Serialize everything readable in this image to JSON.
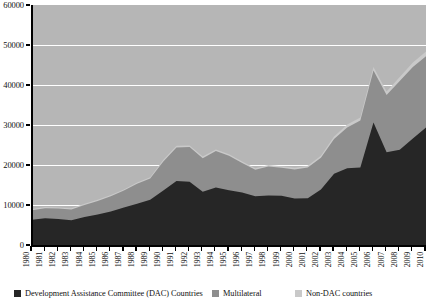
{
  "chart_data": {
    "type": "area",
    "stacked": true,
    "title": "",
    "subtitle": "",
    "xlabel": "",
    "ylabel": "",
    "ylim": [
      0,
      60000
    ],
    "ytick_labels": [
      "0",
      "10000",
      "20000",
      "30000",
      "40000",
      "50000",
      "60000"
    ],
    "ytick_values": [
      0,
      10000,
      20000,
      30000,
      40000,
      50000,
      60000
    ],
    "grid": "horizontal-white",
    "legend_position": "bottom",
    "x": [
      1980,
      1981,
      1982,
      1983,
      1984,
      1985,
      1986,
      1987,
      1988,
      1989,
      1990,
      1991,
      1992,
      1993,
      1994,
      1995,
      1996,
      1997,
      1998,
      1999,
      2000,
      2001,
      2002,
      2003,
      2004,
      2005,
      2006,
      2007,
      2008,
      2009,
      2010
    ],
    "categories": [
      "1980",
      "1981",
      "1982",
      "1983",
      "1984",
      "1985",
      "1986",
      "1987",
      "1988",
      "1989",
      "1990",
      "1991",
      "1992",
      "1993",
      "1994",
      "1995",
      "1996",
      "1997",
      "1998",
      "1999",
      "2000",
      "2001",
      "2002",
      "2003",
      "2004",
      "2005",
      "2006",
      "2007",
      "2008",
      "2009",
      "2010"
    ],
    "series": [
      {
        "name": "Development Assistance Committee (DAC) Countries",
        "color": "#262626",
        "values": [
          6300,
          6700,
          6500,
          6200,
          7000,
          7600,
          8400,
          9400,
          10300,
          11300,
          13600,
          16000,
          15800,
          13300,
          14400,
          13700,
          13100,
          12200,
          12400,
          12300,
          11600,
          11700,
          13900,
          17800,
          19200,
          19400,
          30600,
          23200,
          23800,
          26600,
          29400
        ]
      },
      {
        "name": "Multilateral",
        "color": "#8e8e8e",
        "values": [
          2400,
          2500,
          2600,
          2700,
          3000,
          3400,
          3800,
          4200,
          5000,
          5300,
          7300,
          8400,
          8700,
          8400,
          9100,
          8600,
          7400,
          6600,
          7200,
          7000,
          7300,
          7700,
          7900,
          8700,
          10200,
          11700,
          13000,
          14300,
          17200,
          17900,
          17800
        ]
      },
      {
        "name": "Non-DAC countries",
        "color": "#c9c9c9",
        "values": [
          300,
          300,
          300,
          300,
          300,
          300,
          300,
          300,
          350,
          350,
          400,
          400,
          400,
          400,
          400,
          400,
          400,
          400,
          400,
          400,
          400,
          400,
          500,
          600,
          700,
          800,
          900,
          900,
          1000,
          1100,
          1200
        ]
      }
    ],
    "totals": [
      9000,
      9500,
      9400,
      9200,
      10300,
      11300,
      12500,
      13900,
      15650,
      16950,
      21300,
      24800,
      24900,
      22100,
      23900,
      22700,
      20900,
      19200,
      20000,
      19700,
      19300,
      19800,
      22300,
      27100,
      30100,
      31900,
      44500,
      38400,
      42000,
      45600,
      48400
    ]
  },
  "legend": {
    "items": [
      {
        "label": "Development Assistance Committee (DAC) Countries",
        "color": "#262626"
      },
      {
        "label": "Multilateral",
        "color": "#8e8e8e"
      },
      {
        "label": "Non-DAC countries",
        "color": "#c9c9c9"
      }
    ]
  },
  "colors": {
    "plot_background": "#b6b6b6",
    "gridline": "#ffffff",
    "axis": "#000000",
    "page_background": "#ffffff"
  }
}
